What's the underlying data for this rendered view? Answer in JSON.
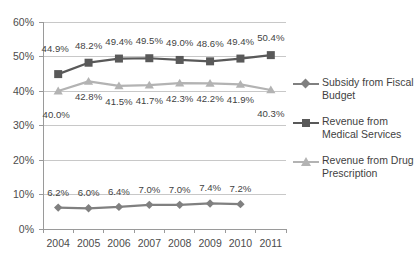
{
  "chart_data": {
    "type": "line",
    "title": "",
    "subtitle": "",
    "xlabel": "",
    "ylabel": "",
    "categories": [
      "2004",
      "2005",
      "2006",
      "2007",
      "2008",
      "2009",
      "2010",
      "2011"
    ],
    "ylim": [
      0,
      60
    ],
    "yticks": [
      0,
      10,
      20,
      30,
      40,
      50,
      60
    ],
    "ytick_labels": [
      "0%",
      "10%",
      "20%",
      "30%",
      "40%",
      "50%",
      "60%"
    ],
    "grid": true,
    "legend_position": "right",
    "value_suffix": "%",
    "series": [
      {
        "name": "Subsidy from Fiscal Budget",
        "marker": "diamond",
        "color": "#808080",
        "values": [
          6.2,
          6.0,
          6.4,
          7.0,
          7.0,
          7.4,
          7.2,
          null
        ],
        "labels": [
          "6.2%",
          "6.0%",
          "6.4%",
          "7.0%",
          "7.0%",
          "7.4%",
          "7.2%",
          ""
        ]
      },
      {
        "name": "Revenue from Medical Services",
        "marker": "square",
        "color": "#595959",
        "values": [
          44.9,
          48.2,
          49.4,
          49.5,
          49.0,
          48.6,
          49.4,
          50.4
        ],
        "labels": [
          "44.9%",
          "48.2%",
          "49.4%",
          "49.5%",
          "49.0%",
          "48.6%",
          "49.4%",
          "50.4%"
        ]
      },
      {
        "name": "Revenue from Drug Prescription",
        "marker": "triangle",
        "color": "#b3b3b3",
        "values": [
          40.0,
          42.8,
          41.5,
          41.7,
          42.3,
          42.2,
          41.9,
          40.3
        ],
        "labels": [
          "40.0%",
          "42.8%",
          "41.5%",
          "41.7%",
          "42.3%",
          "42.2%",
          "41.9%",
          "40.3%"
        ]
      }
    ]
  },
  "legend": {
    "entries": [
      {
        "label": "Subsidy from Fiscal Budget"
      },
      {
        "label": "Revenue from Medical Services"
      },
      {
        "label": "Revenue from Drug Prescription"
      }
    ]
  },
  "colors": {
    "subsidy": "#808080",
    "medical": "#595959",
    "drug": "#b3b3b3",
    "grid": "#c8c8c8",
    "axis": "#9a9a9a",
    "text": "#3f3f3f",
    "background": "#ffffff"
  }
}
